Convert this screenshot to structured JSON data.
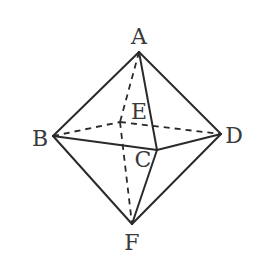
{
  "diagram": {
    "vertices": {
      "A": {
        "label": "A",
        "x": 139,
        "y": 52,
        "label_x": 139,
        "label_y": 37
      },
      "B": {
        "label": "B",
        "x": 53,
        "y": 136,
        "label_x": 40,
        "label_y": 139
      },
      "C": {
        "label": "C",
        "x": 157,
        "y": 150,
        "label_x": 143,
        "label_y": 160
      },
      "D": {
        "label": "D",
        "x": 221,
        "y": 134,
        "label_x": 234,
        "label_y": 136
      },
      "E": {
        "label": "E",
        "x": 120,
        "y": 122,
        "label_x": 139,
        "label_y": 112
      },
      "F": {
        "label": "F",
        "x": 132,
        "y": 224,
        "label_x": 132,
        "label_y": 243
      }
    },
    "solid_edges": [
      [
        "A",
        "B"
      ],
      [
        "A",
        "C"
      ],
      [
        "A",
        "D"
      ],
      [
        "B",
        "C"
      ],
      [
        "C",
        "D"
      ],
      [
        "B",
        "F"
      ],
      [
        "C",
        "F"
      ],
      [
        "D",
        "F"
      ]
    ],
    "hidden_edges": [
      [
        "A",
        "E"
      ],
      [
        "B",
        "E"
      ],
      [
        "E",
        "D"
      ],
      [
        "E",
        "F"
      ]
    ],
    "stroke_color": "#2a2a2a"
  }
}
